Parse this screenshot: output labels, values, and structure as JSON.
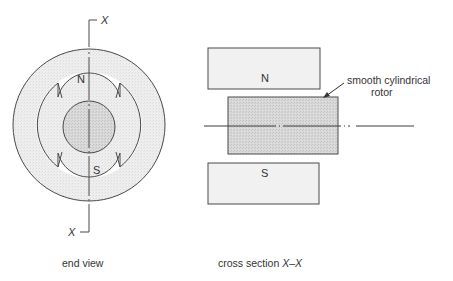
{
  "figure": {
    "end_view": {
      "caption": "end view",
      "section_marker_top": "X",
      "section_marker_bottom": "X",
      "pole_north_label": "N",
      "pole_south_label": "S"
    },
    "cross_section": {
      "caption_prefix": "cross section ",
      "caption_section": "X–X",
      "pole_north_label": "N",
      "pole_south_label": "S",
      "rotor_annotation_line1": "smooth cylindrical",
      "rotor_annotation_line2": "rotor"
    }
  },
  "colors": {
    "stroke": "#4a4a4a",
    "stator_fill": "#ececec",
    "rotor_fill": "#d4d4d4",
    "text": "#333333"
  }
}
